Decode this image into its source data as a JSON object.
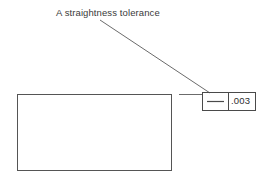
{
  "drawing": {
    "annotation": {
      "label": "A straightness tolerance"
    },
    "feature_control_frame": {
      "symbol_name": "straightness-symbol",
      "tolerance_value": ".003"
    },
    "part": {
      "shape_name": "rectangular-part-outline"
    },
    "colors": {
      "background": "#ffffff",
      "line": "#6b6b6b",
      "part_line": "#555555",
      "text": "#3a3a3a"
    }
  }
}
